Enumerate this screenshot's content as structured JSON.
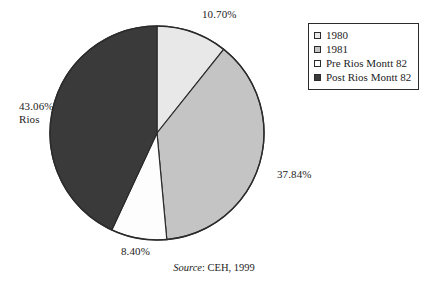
{
  "chart_data": {
    "type": "pie",
    "title": "",
    "subtitle": "",
    "xlabel": "",
    "ylabel": "",
    "grid": false,
    "legend_position": "top-right",
    "start_angle_deg": 0,
    "direction": "clockwise",
    "units": "percent",
    "categories": [
      "1980",
      "1981",
      "Pre Rios Montt 82",
      "Post Rios Montt 82"
    ],
    "values": [
      10.7,
      37.84,
      8.4,
      43.06
    ],
    "value_labels": [
      "10.70%",
      "37.84%",
      "8.40%",
      "43.06%"
    ],
    "colors": [
      "#e8e8e8",
      "#c4c4c4",
      "#fdfdfd",
      "#3a3a3a"
    ],
    "slices": [
      {
        "name": "1980",
        "value": 10.7,
        "label": "10.70%",
        "sub_label": "",
        "color": "#e8e8e8",
        "label_position": "top-right"
      },
      {
        "name": "1981",
        "value": 37.84,
        "label": "37.84%",
        "sub_label": "",
        "color": "#c4c4c4",
        "label_position": "right"
      },
      {
        "name": "Pre Rios Montt 82",
        "value": 8.4,
        "label": "8.40%",
        "sub_label": "",
        "color": "#fdfdfd",
        "label_position": "bottom"
      },
      {
        "name": "Post Rios Montt 82",
        "value": 43.06,
        "label": "43.06%",
        "sub_label": "Rios",
        "color": "#3a3a3a",
        "label_position": "left"
      }
    ]
  },
  "legend": {
    "items": [
      {
        "label": "1980",
        "color": "#e8e8e8"
      },
      {
        "label": "1981",
        "color": "#c4c4c4"
      },
      {
        "label": "Pre Rios Montt 82",
        "color": "#fdfdfd"
      },
      {
        "label": "Post Rios Montt 82",
        "color": "#3a3a3a"
      }
    ]
  },
  "caption": {
    "source_word": "Source",
    "source_text": ": CEH, 1999"
  },
  "style": {
    "outline": "#2b2b2b",
    "background": "#ffffff",
    "text": "#1c1c1c"
  }
}
